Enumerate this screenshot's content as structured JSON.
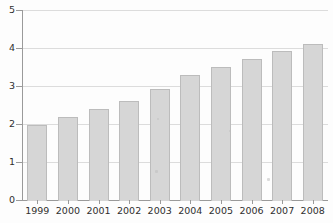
{
  "chart_data": {
    "type": "bar",
    "title": "",
    "subtitle": "",
    "xlabel": "",
    "ylabel": "",
    "categories": [
      "1999",
      "2000",
      "2001",
      "2002",
      "2003",
      "2004",
      "2005",
      "2006",
      "2007",
      "2008"
    ],
    "values": [
      2.0,
      2.21,
      2.41,
      2.61,
      2.92,
      3.31,
      3.52,
      3.71,
      3.93,
      4.11
    ],
    "series": [
      {
        "name": "",
        "values": [
          2.0,
          2.21,
          2.41,
          2.61,
          2.92,
          3.31,
          3.52,
          3.71,
          3.93,
          4.11
        ]
      }
    ],
    "ylim": [
      0,
      5
    ],
    "yticks": [
      0,
      1,
      2,
      3,
      4,
      5
    ],
    "ytick_labels": [
      "0",
      "1",
      "2",
      "3",
      "4",
      "5"
    ],
    "xtick_labels": [
      "1999",
      "2000",
      "2001",
      "2002",
      "2003",
      "2004",
      "2005",
      "2006",
      "2007",
      "2008"
    ],
    "grid": true,
    "grid_axis": "y",
    "legend": false,
    "legend_position": "none",
    "annotations": [],
    "colors": {
      "bar_fill": "#d6d6d6",
      "bar_border": "#bcbcbc",
      "gridline": "#dcdcdc",
      "axis_line": "#9a9a9a",
      "tick_label": "#2f2f2f",
      "background": "#fdfdfd"
    }
  }
}
